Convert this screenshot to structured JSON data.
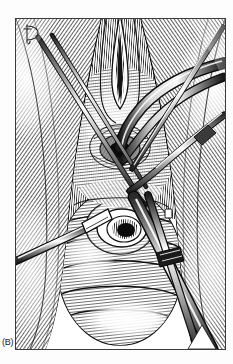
{
  "figure": {
    "panel_label": "(B)",
    "title": "Operative field illustration, panel B",
    "medium": "pen-and-ink line engraving, black on white",
    "signature_monogram": "D",
    "frame": {
      "x": 15,
      "y": 18,
      "width": 211,
      "height": 332,
      "border_color": "#3b3b3b",
      "border_width": 1
    },
    "palette": {
      "ink": "#111111",
      "mid_ink": "#555555",
      "light_ink": "#9a9a9a",
      "paper": "#ffffff",
      "page_background": "#fdfdfd",
      "frame_line": "#3b3b3b"
    },
    "scene": {
      "description": "Deep surgical exposure rendered in cross-hatch engraving, with two circular openings in the midline and several slender instruments entering the field from the left, upper right and lower right.",
      "elements": [
        {
          "name": "field-hatching-left",
          "label": "Left tissue wall hatching",
          "note": "Dense diagonal hatch lines sweeping from upper-left down to lower-left"
        },
        {
          "name": "field-hatching-right",
          "label": "Right tissue wall hatching",
          "note": "Dense diagonal hatch lines sweeping from upper-right down to lower-right"
        },
        {
          "name": "midline-cleft",
          "label": "Midline incision cleft",
          "note": "Vertical converging cleft at the top centre of the field"
        },
        {
          "name": "upper-orifice",
          "label": "Upper circular orifice",
          "note": "Round opening at roughly one third height, with a tubular structure passing into it"
        },
        {
          "name": "tubular-structure",
          "label": "Curved tubular structure",
          "note": "Thick curved tube arcing from the upper right into the upper orifice"
        },
        {
          "name": "lower-orifice",
          "label": "Lower circular orifice",
          "note": "Larger concentric ring opening at mid height with shaded lumen"
        },
        {
          "name": "bulbous-mass",
          "label": "Bulbous mass",
          "note": "Rounded, banded mass filling the lower half of the field"
        },
        {
          "name": "instrument-left",
          "label": "Left instrument tip",
          "note": "Tapered blade entering horizontally from the left margin"
        },
        {
          "name": "instrument-upper-right-a",
          "label": "Upper right instrument A",
          "note": "Long slender shaft from the top-right corner to the centre"
        },
        {
          "name": "instrument-upper-right-b",
          "label": "Upper right instrument B",
          "note": "Second slender shaft crossing the first near the right margin"
        },
        {
          "name": "instrument-upper-left",
          "label": "Upper left instrument",
          "note": "Slim pair of shafts descending from the upper left toward the centre"
        },
        {
          "name": "instrument-lower-right",
          "label": "Lower right clamp",
          "note": "Broad forceps/clamp running diagonally across the lower right quadrant"
        },
        {
          "name": "highlight-lower",
          "label": "Lower highlight",
          "note": "Bright unhatched reflection across the lower centre"
        }
      ]
    }
  }
}
